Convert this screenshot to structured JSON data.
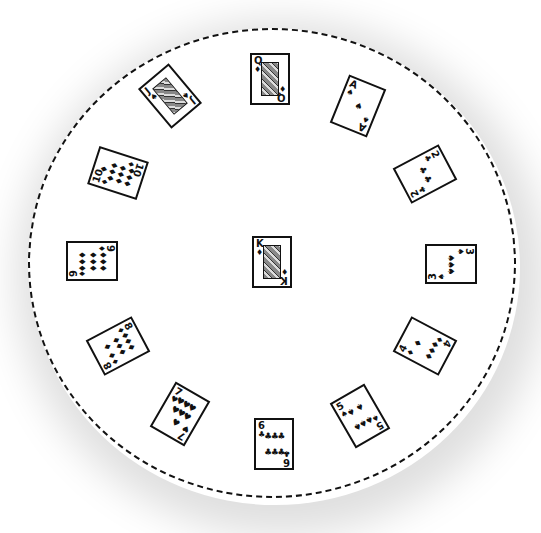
{
  "scene": {
    "description": "Hand-drawn clock solitaire layout: 12 cards around a circular table with a King in the center",
    "table_border_color": "#111111",
    "background_color": "#ffffff"
  },
  "cards": [
    {
      "position": "12",
      "rank": "Q",
      "suit": "♦",
      "suit_name": "diamonds",
      "x": 250,
      "y": 53,
      "rot": 0,
      "face": true
    },
    {
      "position": "1",
      "rank": "A",
      "suit": "♠",
      "suit_name": "spades",
      "x": 338,
      "y": 80,
      "rot": 22,
      "face": false,
      "pips": [
        "♠"
      ]
    },
    {
      "position": "2",
      "rank": "2",
      "suit": "♣",
      "suit_name": "clubs",
      "x": 405,
      "y": 148,
      "rot": 62,
      "face": false,
      "pips": [
        "♣",
        "♣"
      ]
    },
    {
      "position": "3",
      "rank": "3",
      "suit": "♠",
      "suit_name": "spades",
      "x": 431,
      "y": 238,
      "rot": 90,
      "face": false,
      "pips": [
        "♠",
        "♠",
        "♠"
      ]
    },
    {
      "position": "4",
      "rank": "4",
      "suit": "♦",
      "suit_name": "diamonds",
      "x": 405,
      "y": 320,
      "rot": 118,
      "face": false,
      "pips": [
        "♦",
        "♦",
        "♦",
        "♦"
      ]
    },
    {
      "position": "5",
      "rank": "5",
      "suit": "♠",
      "suit_name": "spades",
      "x": 340,
      "y": 390,
      "rot": 150,
      "face": false,
      "pips": [
        "♠",
        "♠",
        "♠",
        "♠",
        "♠"
      ]
    },
    {
      "position": "6",
      "rank": "6",
      "suit": "♣",
      "suit_name": "clubs",
      "x": 254,
      "y": 418,
      "rot": 0,
      "face": false,
      "pips": [
        "♣",
        "♣",
        "♣",
        "♣",
        "♣",
        "♣"
      ]
    },
    {
      "position": "7",
      "rank": "7",
      "suit": "♥",
      "suit_name": "hearts",
      "x": 160,
      "y": 388,
      "rot": 30,
      "face": false,
      "pips": [
        "♥",
        "♥",
        "♥",
        "♥",
        "♥",
        "♥",
        "♥"
      ]
    },
    {
      "position": "8",
      "rank": "8",
      "suit": "♦",
      "suit_name": "diamonds",
      "x": 98,
      "y": 320,
      "rot": 62,
      "face": false,
      "pips": [
        "♦",
        "♦",
        "♦",
        "♦",
        "♦",
        "♦",
        "♦",
        "♦"
      ]
    },
    {
      "position": "9",
      "rank": "9",
      "suit": "♦",
      "suit_name": "diamonds",
      "x": 72,
      "y": 235,
      "rot": 90,
      "face": false,
      "pips": [
        "♦",
        "♦",
        "♦",
        "♦",
        "♦",
        "♦",
        "♦",
        "♦",
        "♦"
      ]
    },
    {
      "position": "10",
      "rank": "10",
      "suit": "♦",
      "suit_name": "diamonds",
      "x": 98,
      "y": 147,
      "rot": 108,
      "face": false,
      "pips": [
        "♦",
        "♦",
        "♦",
        "♦",
        "♦",
        "♦",
        "♦",
        "♦",
        "♦",
        "♦"
      ]
    },
    {
      "position": "11",
      "rank": "J",
      "suit": "♠",
      "suit_name": "spades",
      "x": 150,
      "y": 70,
      "rot": 140,
      "face": true
    },
    {
      "position": "center",
      "rank": "K",
      "suit": "♦",
      "suit_name": "diamonds",
      "x": 252,
      "y": 236,
      "rot": 0,
      "face": true
    }
  ]
}
